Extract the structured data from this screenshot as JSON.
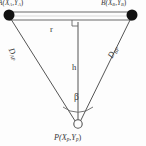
{
  "figure": {
    "background_color": "#fdfdfd",
    "stroke_color": "#4a4a4a",
    "node_fill_color": "#111111",
    "text_color": "#3a3a3a"
  },
  "nodes": {
    "anchor_a": {
      "label_main": "A(",
      "label_x": "X",
      "label_x_sub": "A",
      "label_comma": ",",
      "label_y": "Y",
      "label_y_sub": "A",
      "label_close": ")",
      "x": 9,
      "y": 15,
      "style": "filled-circle",
      "radius": 5.5
    },
    "anchor_b": {
      "label_main": "B(",
      "label_x": "X",
      "label_x_sub": "B",
      "label_comma": ",",
      "label_y": "Y",
      "label_y_sub": "B",
      "label_close": ")",
      "x": 132,
      "y": 15,
      "style": "filled-circle",
      "radius": 5.5
    },
    "target_p": {
      "label_main": "P(",
      "label_x": "X",
      "label_x_sub": "p",
      "label_comma": ",",
      "label_y": "Y",
      "label_y_sub": "p",
      "label_close": ")",
      "x": 78,
      "y": 124,
      "style": "open-circle",
      "radius": 4.2
    }
  },
  "segments": {
    "baseline": {
      "label": "r",
      "from": "anchor_a",
      "to": "anchor_b",
      "style": "double-line-bar"
    },
    "height": {
      "label": "h",
      "from": "baseline-midpoint",
      "to": "target_p",
      "style": "solid-line",
      "has_right_angle_marker": true
    },
    "distance_ap": {
      "label_main": "D",
      "label_sub": "AP",
      "from": "anchor_a",
      "to": "target_p",
      "style": "solid-line"
    },
    "distance_bp": {
      "label_main": "D",
      "label_sub": "BP",
      "from": "anchor_b",
      "to": "target_p",
      "style": "solid-line"
    }
  },
  "angle": {
    "label": "β",
    "vertex": "target_p",
    "between": [
      "distance_ap",
      "distance_bp"
    ],
    "marker": "arc"
  }
}
